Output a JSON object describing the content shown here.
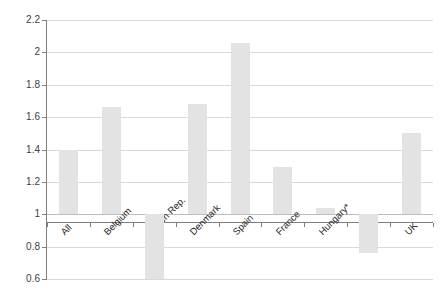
{
  "chart_data": {
    "type": "bar",
    "title": "",
    "xlabel": "",
    "ylabel": "",
    "categories": [
      "All",
      "Belgium",
      "Czech Rep.",
      "Denmark",
      "Spain",
      "France",
      "Hungary*",
      "Italy",
      "UK"
    ],
    "values": [
      1.4,
      1.66,
      0.6,
      1.68,
      2.06,
      1.29,
      1.04,
      0.76,
      1.5
    ],
    "ylim": [
      0.6,
      2.2
    ],
    "ytick_labels": [
      "2.2",
      "2",
      "1.8",
      "1.6",
      "1.4",
      "1.2",
      "1",
      "0.8",
      "0.6"
    ],
    "ytick_values": [
      2.2,
      2.0,
      1.8,
      1.6,
      1.4,
      1.2,
      1.0,
      0.8,
      0.6
    ],
    "baseline": 1.0,
    "grid": true,
    "legend": "none",
    "bar_color": "#e3e3e3",
    "gridline_color": "#d9d9d9",
    "axis_color": "#7f7f7f"
  },
  "colors": {
    "bar": "#e3e3e3",
    "grid": "#d9d9d9",
    "axis": "#7f7f7f",
    "text": "#262626"
  }
}
